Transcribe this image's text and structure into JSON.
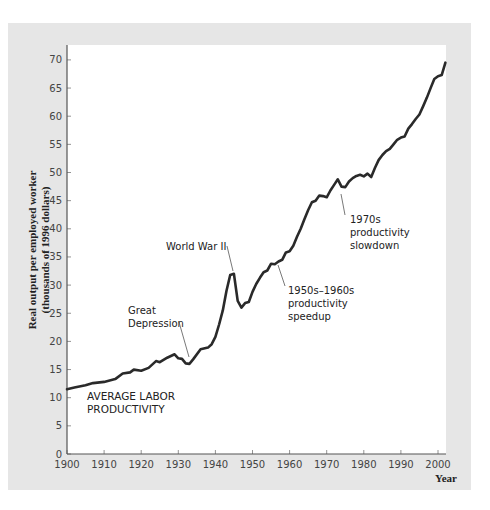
{
  "chart_data": {
    "type": "line",
    "title": "",
    "xlabel": "Year",
    "ylabel": "Real output per employed worker (thousands of 1996 dollars)",
    "ylabel_lines": [
      "Real output per employed worker",
      "(thousands of 1996 dollars)"
    ],
    "xlim": [
      1900,
      2002
    ],
    "ylim": [
      0,
      72
    ],
    "x_ticks": [
      1900,
      1910,
      1920,
      1930,
      1940,
      1950,
      1960,
      1970,
      1980,
      1990,
      2000
    ],
    "y_ticks": [
      0,
      5,
      10,
      15,
      20,
      25,
      30,
      35,
      40,
      45,
      50,
      55,
      60,
      65,
      70
    ],
    "grid": false,
    "legend": null,
    "series": [
      {
        "name": "Average labor productivity",
        "color": "#2a2a2a",
        "x": [
          1900,
          1902,
          1905,
          1907,
          1910,
          1913,
          1915,
          1917,
          1918,
          1920,
          1922,
          1924,
          1925,
          1927,
          1929,
          1930,
          1931,
          1932,
          1933,
          1934,
          1936,
          1938,
          1939,
          1940,
          1941,
          1942,
          1943,
          1944,
          1945,
          1946,
          1947,
          1948,
          1949,
          1950,
          1951,
          1952,
          1953,
          1954,
          1955,
          1956,
          1957,
          1958,
          1959,
          1960,
          1961,
          1962,
          1963,
          1964,
          1965,
          1966,
          1967,
          1968,
          1969,
          1970,
          1971,
          1972,
          1973,
          1974,
          1975,
          1976,
          1977,
          1978,
          1979,
          1980,
          1981,
          1982,
          1983,
          1984,
          1985,
          1986,
          1987,
          1988,
          1989,
          1990,
          1991,
          1992,
          1993,
          1994,
          1995,
          1996,
          1997,
          1998,
          1999,
          2000,
          2001,
          2002
        ],
        "values": [
          11.5,
          11.8,
          12.2,
          12.6,
          12.8,
          13.3,
          14.3,
          14.5,
          15.0,
          14.8,
          15.3,
          16.5,
          16.3,
          17.1,
          17.7,
          17.0,
          16.9,
          16.1,
          16.0,
          16.8,
          18.6,
          18.9,
          19.5,
          20.8,
          23.0,
          25.5,
          29.0,
          31.8,
          32.0,
          27.2,
          26.0,
          26.8,
          27.0,
          28.8,
          30.2,
          31.3,
          32.3,
          32.6,
          33.8,
          33.7,
          34.2,
          34.5,
          35.8,
          36.0,
          37.0,
          38.6,
          40.0,
          41.7,
          43.3,
          44.7,
          45.0,
          45.9,
          45.8,
          45.6,
          46.8,
          47.8,
          48.8,
          47.5,
          47.4,
          48.4,
          49.0,
          49.4,
          49.6,
          49.3,
          49.8,
          49.2,
          50.8,
          52.2,
          53.1,
          53.8,
          54.2,
          55.0,
          55.8,
          56.2,
          56.4,
          57.8,
          58.6,
          59.5,
          60.3,
          61.8,
          63.3,
          65.0,
          66.6,
          67.1,
          67.3,
          69.5
        ]
      }
    ],
    "annotations": [
      {
        "id": "series_label",
        "lines": [
          "AVERAGE LABOR",
          "PRODUCTIVITY"
        ]
      },
      {
        "id": "great_depression",
        "lines": [
          "Great",
          "Depression"
        ],
        "points_to": {
          "x": 1932.5,
          "y": 16.3
        }
      },
      {
        "id": "wwii",
        "lines": [
          "World War II"
        ],
        "points_to": {
          "x": 1944.5,
          "y": 32.5
        }
      },
      {
        "id": "speedup",
        "lines": [
          "1950s–1960s",
          "productivity",
          "speedup"
        ],
        "points_to": {
          "x": 1956.5,
          "y": 34.3
        }
      },
      {
        "id": "slowdown",
        "lines": [
          "1970s",
          "productivity",
          "slowdown"
        ],
        "points_to": {
          "x": 1974,
          "y": 47.3
        }
      }
    ]
  },
  "colors": {
    "panel_bg": "#e6e6e6",
    "plot_bg": "#ffffff",
    "line": "#2a2a2a",
    "axis": "#555555",
    "leader": "#555555"
  }
}
